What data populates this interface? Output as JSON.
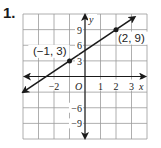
{
  "exercise_number": "1.",
  "chart_data": {
    "type": "line",
    "title": "",
    "xlabel": "x",
    "ylabel": "y",
    "origin_label": "O",
    "xlim": [
      -4,
      4
    ],
    "ylim": [
      -12,
      12
    ],
    "x_step": 1,
    "y_step": 3,
    "grid": true,
    "x_tick_labels": [
      {
        "value": -2,
        "label": "−2"
      },
      {
        "value": 1,
        "label": "1"
      },
      {
        "value": 2,
        "label": "2"
      },
      {
        "value": 3,
        "label": "3"
      }
    ],
    "y_tick_labels": [
      {
        "value": 9,
        "label": "9"
      },
      {
        "value": 6,
        "label": "6"
      },
      {
        "value": 3,
        "label": "3"
      },
      {
        "value": -6,
        "label": "−6"
      },
      {
        "value": -9,
        "label": "−9"
      }
    ],
    "series": [
      {
        "name": "line",
        "equation": "y = 2x + 5",
        "slope": 2,
        "intercept": 5,
        "points": [
          {
            "x": -1,
            "y": 3,
            "label": "(−1, 3)"
          },
          {
            "x": 2,
            "y": 9,
            "label": "(2, 9)"
          }
        ],
        "arrows_both_ends": true
      }
    ]
  }
}
